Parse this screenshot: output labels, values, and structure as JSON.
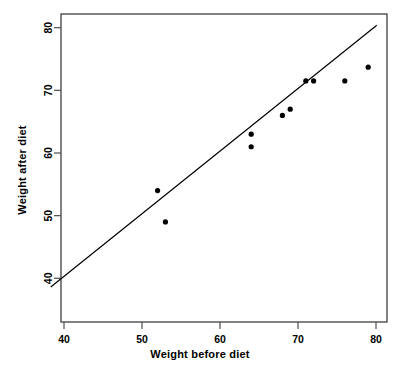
{
  "figure": {
    "type": "scatter-plot",
    "background_color": "#ffffff",
    "frame_color": "#4d4d4d",
    "point_color": "#000000",
    "line_color": "#000000"
  },
  "axis_titles": {
    "x": "Weight before diet",
    "y": "Weight after diet"
  },
  "chart_data": {
    "type": "scatter",
    "title": "",
    "xlabel": "Weight before diet",
    "ylabel": "Weight after diet",
    "xlim": [
      38,
      81.5
    ],
    "ylim": [
      38.5,
      81
    ],
    "xticks": [
      40,
      50,
      60,
      70,
      80
    ],
    "yticks": [
      40,
      50,
      60,
      70,
      80
    ],
    "xtick_labels": [
      "40",
      "50",
      "60",
      "70",
      "80"
    ],
    "ytick_labels": [
      "40",
      "50",
      "60",
      "70",
      "80"
    ],
    "grid": false,
    "legend": false,
    "series": [
      {
        "name": "observations",
        "marker": "filled-circle",
        "color": "#000000",
        "points": [
          {
            "x": 52,
            "y": 54
          },
          {
            "x": 53,
            "y": 49
          },
          {
            "x": 64,
            "y": 63
          },
          {
            "x": 64,
            "y": 61
          },
          {
            "x": 68,
            "y": 66
          },
          {
            "x": 69,
            "y": 67
          },
          {
            "x": 71,
            "y": 71.5
          },
          {
            "x": 72,
            "y": 71.5
          },
          {
            "x": 76,
            "y": 71.5
          },
          {
            "x": 79,
            "y": 73.7
          }
        ]
      }
    ],
    "reference_line": {
      "name": "identity-line",
      "description": "y = x reference line",
      "slope": 1,
      "intercept": 0,
      "x_start": 38.3,
      "y_start": 38.6,
      "x_end": 80.1,
      "y_end": 80.4,
      "color": "#000000"
    }
  }
}
